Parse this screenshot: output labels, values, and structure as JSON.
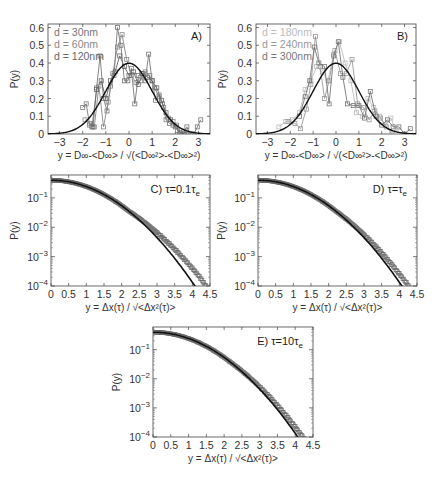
{
  "chart_data": [
    {
      "id": "A",
      "type": "line",
      "panel_label": "A)",
      "xlabel": "y = D∞-<D∞> / √(<D∞²>-<D∞>²)",
      "ylabel": "P(y)",
      "xlim": [
        -3.5,
        3.5
      ],
      "ylim": [
        0,
        0.62
      ],
      "yscale": "linear",
      "xticks": [
        "-3",
        "-2",
        "-1",
        "0",
        "1",
        "2",
        "3"
      ],
      "yticks": [
        "0",
        "0.1",
        "0.2",
        "0.3",
        "0.4",
        "0.5",
        "0.6"
      ],
      "legend_position": "upper-left",
      "reference_curve": {
        "name": "Gaussian",
        "mean": 0,
        "sigma": 1,
        "color": "#111111"
      },
      "series": [
        {
          "name": "d = 30nm",
          "color": "#777777",
          "x": [
            -2.0,
            -1.85,
            -1.7,
            -1.55,
            -1.4,
            -1.25,
            -1.1,
            -0.95,
            -0.8,
            -0.65,
            -0.5,
            -0.35,
            -0.2,
            -0.05,
            0.1,
            0.25,
            0.4,
            0.55,
            0.7,
            0.85,
            1.0,
            1.15,
            1.3,
            1.45,
            1.6,
            1.75,
            1.9,
            2.05,
            2.2,
            2.35,
            2.5,
            2.65,
            2.8,
            2.95,
            3.1
          ],
          "y": [
            0.15,
            0.17,
            0.05,
            0.04,
            0.26,
            0.44,
            0.2,
            0.13,
            0.27,
            0.33,
            0.6,
            0.5,
            0.3,
            0.3,
            0.37,
            0.17,
            0.33,
            0.34,
            0.3,
            0.45,
            0.3,
            0.19,
            0.22,
            0.17,
            0.08,
            0.06,
            0.05,
            0.05,
            0.0,
            0.0,
            0.04,
            0.0,
            0.0,
            0.04,
            0.08
          ]
        },
        {
          "name": "d = 60nm",
          "color": "#888888",
          "x": [
            -1.9,
            -1.7,
            -1.5,
            -1.3,
            -1.1,
            -0.9,
            -0.7,
            -0.5,
            -0.3,
            -0.1,
            0.1,
            0.3,
            0.5,
            0.7,
            0.9,
            1.1,
            1.3,
            1.5,
            1.7,
            1.9,
            2.1,
            2.3,
            2.5,
            2.7
          ],
          "y": [
            0.08,
            0.06,
            0.04,
            0.27,
            0.04,
            0.18,
            0.34,
            0.49,
            0.56,
            0.42,
            0.33,
            0.29,
            0.3,
            0.35,
            0.33,
            0.26,
            0.21,
            0.15,
            0.09,
            0.07,
            0.02,
            0.0,
            0.01,
            0.0
          ]
        },
        {
          "name": "d = 120nm",
          "color": "#666666",
          "x": [
            -1.6,
            -1.4,
            -1.2,
            -1.0,
            -0.8,
            -0.6,
            -0.4,
            -0.2,
            0.0,
            0.2,
            0.4,
            0.6,
            0.8,
            1.0,
            1.2,
            1.4,
            1.6,
            1.8,
            2.0,
            2.2,
            2.4
          ],
          "y": [
            0.04,
            0.25,
            0.3,
            0.2,
            0.3,
            0.35,
            0.44,
            0.38,
            0.33,
            0.35,
            0.28,
            0.34,
            0.32,
            0.3,
            0.26,
            0.19,
            0.12,
            0.08,
            0.04,
            0.01,
            0.0
          ]
        }
      ]
    },
    {
      "id": "B",
      "type": "line",
      "panel_label": "B)",
      "xlabel": "y = D∞-<D∞> / √(<D∞²>-<D∞>²)",
      "ylabel": "P(y)",
      "xlim": [
        -3.5,
        3.5
      ],
      "ylim": [
        0,
        0.62
      ],
      "yscale": "linear",
      "xticks": [
        "-3",
        "-2",
        "-1",
        "0",
        "1",
        "2",
        "3"
      ],
      "yticks": [
        "0",
        "0.1",
        "0.2",
        "0.3",
        "0.4",
        "0.5",
        "0.6"
      ],
      "legend_position": "upper-left",
      "reference_curve": {
        "name": "Gaussian",
        "mean": 0,
        "sigma": 1,
        "color": "#111111"
      },
      "series": [
        {
          "name": "d = 180nm",
          "color": "#bbbbbb",
          "x": [
            -2.5,
            -2.2,
            -1.9,
            -1.6,
            -1.35,
            -1.1,
            -0.85,
            -0.6,
            -0.35,
            -0.1,
            0.15,
            0.4,
            0.65,
            0.9,
            1.15,
            1.4,
            1.65,
            1.9,
            2.15,
            2.4,
            2.65
          ],
          "y": [
            0.04,
            0.07,
            0.08,
            0.12,
            0.25,
            0.3,
            0.38,
            0.35,
            0.3,
            0.45,
            0.52,
            0.4,
            0.3,
            0.12,
            0.1,
            0.2,
            0.15,
            0.1,
            0.05,
            0.09,
            0.01
          ]
        },
        {
          "name": "d = 240nm",
          "color": "#999999",
          "x": [
            -2.1,
            -1.8,
            -1.55,
            -1.3,
            -1.1,
            -0.9,
            -0.7,
            -0.5,
            -0.3,
            -0.05,
            0.2,
            0.45,
            0.7,
            0.95,
            1.2,
            1.45,
            1.7,
            1.95,
            2.2,
            2.45
          ],
          "y": [
            0.07,
            0.06,
            0.03,
            0.14,
            0.28,
            0.55,
            0.38,
            0.2,
            0.3,
            0.47,
            0.34,
            0.34,
            0.42,
            0.17,
            0.15,
            0.08,
            0.13,
            0.09,
            0.04,
            0.0
          ]
        },
        {
          "name": "d = 300nm",
          "color": "#777777",
          "x": [
            -1.6,
            -1.35,
            -1.15,
            -0.95,
            -0.75,
            -0.5,
            -0.3,
            -0.1,
            0.1,
            0.3,
            0.5,
            0.75,
            1.0,
            1.25,
            1.5,
            1.75,
            2.0,
            2.25,
            2.5,
            2.75,
            3.0,
            3.25
          ],
          "y": [
            0.1,
            0.21,
            0.3,
            0.49,
            0.4,
            0.38,
            0.17,
            0.44,
            0.52,
            0.32,
            0.17,
            0.16,
            0.16,
            0.09,
            0.24,
            0.1,
            0.05,
            0.08,
            0.04,
            0.04,
            0.0,
            0.03
          ]
        }
      ]
    },
    {
      "id": "C",
      "type": "scatter",
      "panel_label": "C) τ=0.1τ",
      "panel_label_sub": "e",
      "xlabel": "y = Δx(τ) / √<Δx²(τ)>",
      "ylabel": "P(y)",
      "xlim": [
        0,
        4.5
      ],
      "ylim": [
        0.0001,
        0.6
      ],
      "yscale": "log",
      "xticks": [
        "0",
        "0.5",
        "1",
        "1.5",
        "2",
        "2.5",
        "3",
        "3.5",
        "4",
        "4.5"
      ],
      "yticks": [
        "10^-1",
        "10^-2",
        "10^-3",
        "10^-4"
      ],
      "reference_curve": {
        "name": "Gaussian",
        "mean": 0,
        "sigma": 1,
        "color": "#111111"
      },
      "series": [
        {
          "name": "data",
          "color": "#666666",
          "x_max": 4.45,
          "tail_factor": 1.35
        }
      ]
    },
    {
      "id": "D",
      "type": "scatter",
      "panel_label": "D) τ=τ",
      "panel_label_sub": "e",
      "xlabel": "y = Δx(τ) / √<Δx²(τ)>",
      "ylabel": "P(y)",
      "xlim": [
        0,
        4.5
      ],
      "ylim": [
        0.0001,
        0.6
      ],
      "yscale": "log",
      "xticks": [
        "0",
        "0.5",
        "1",
        "1.5",
        "2",
        "2.5",
        "3",
        "3.5",
        "4",
        "4.5"
      ],
      "yticks": [
        "10^-1",
        "10^-2",
        "10^-3",
        "10^-4"
      ],
      "reference_curve": {
        "name": "Gaussian",
        "mean": 0,
        "sigma": 1,
        "color": "#111111"
      },
      "series": [
        {
          "name": "data",
          "color": "#666666",
          "x_max": 4.35,
          "tail_factor": 1.2
        }
      ]
    },
    {
      "id": "E",
      "type": "scatter",
      "panel_label": "E) τ=10τ",
      "panel_label_sub": "e",
      "xlabel": "y = Δx(τ) / √<Δx²(τ)>",
      "ylabel": "P(y)",
      "xlim": [
        0,
        4.5
      ],
      "ylim": [
        0.0001,
        0.6
      ],
      "yscale": "log",
      "xticks": [
        "0",
        "0.5",
        "1",
        "1.5",
        "2",
        "2.5",
        "3",
        "3.5",
        "4",
        "4.5"
      ],
      "yticks": [
        "10^-1",
        "10^-2",
        "10^-3",
        "10^-4"
      ],
      "reference_curve": {
        "name": "Gaussian",
        "mean": 0,
        "sigma": 1,
        "color": "#111111"
      },
      "series": [
        {
          "name": "data",
          "color": "#666666",
          "x_max": 4.25,
          "tail_factor": 1.15
        }
      ]
    }
  ],
  "layout": {
    "panels": {
      "A": {
        "left": 48,
        "top": 24,
        "right": 210,
        "bottom": 134
      },
      "B": {
        "left": 256,
        "top": 24,
        "right": 416,
        "bottom": 134
      },
      "C": {
        "left": 51,
        "top": 175,
        "right": 210,
        "bottom": 286
      },
      "D": {
        "left": 258,
        "top": 175,
        "right": 417,
        "bottom": 286
      },
      "E": {
        "left": 153,
        "top": 327,
        "right": 313,
        "bottom": 437
      }
    }
  }
}
